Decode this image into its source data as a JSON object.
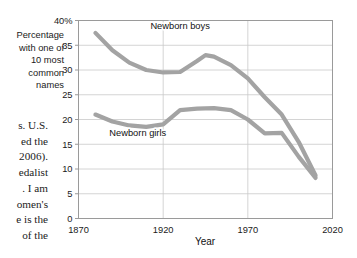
{
  "page_text": {
    "lines": [
      "s. U.S.",
      "ed the",
      "2006).",
      "edalist",
      ". I am",
      "omen's",
      "e is the",
      "of the"
    ]
  },
  "chart_data": {
    "type": "line",
    "title": "",
    "xlabel": "Year",
    "ylabel": "Percentage with one of 10 most common names",
    "ylabel_lines": [
      "Percentage",
      "with one of",
      "10 most",
      "common",
      "names"
    ],
    "xlim": [
      1870,
      2020
    ],
    "ylim": [
      0,
      40
    ],
    "xticks": [
      1870,
      1920,
      1970,
      2020
    ],
    "xtick_labels": [
      "1870",
      "1920",
      "1970",
      "2020"
    ],
    "yticks": [
      0,
      5,
      10,
      15,
      20,
      25,
      30,
      35,
      40
    ],
    "ytick_labels": [
      "0",
      "5",
      "10",
      "15",
      "20",
      "25",
      "30",
      "35",
      "40%"
    ],
    "grid": true,
    "legend_position": "inline-annotation",
    "line_color": "#a3a3a3",
    "series": [
      {
        "name": "Newborn boys",
        "label": "Newborn boys",
        "color": "#a3a3a3",
        "x": [
          1880,
          1890,
          1900,
          1910,
          1920,
          1930,
          1940,
          1945,
          1950,
          1960,
          1970,
          1980,
          1990,
          2000,
          2010
        ],
        "values": [
          37.5,
          34.0,
          31.5,
          30.0,
          29.5,
          29.6,
          31.8,
          33.0,
          32.7,
          31.0,
          28.3,
          24.5,
          21.0,
          15.5,
          8.7
        ]
      },
      {
        "name": "Newborn girls",
        "label": "Newborn girls",
        "color": "#a3a3a3",
        "x": [
          1880,
          1890,
          1900,
          1910,
          1920,
          1930,
          1940,
          1950,
          1960,
          1970,
          1980,
          1990,
          2000,
          2010
        ],
        "values": [
          21.0,
          19.6,
          18.8,
          18.5,
          19.0,
          21.9,
          22.2,
          22.3,
          21.9,
          20.0,
          17.2,
          17.3,
          12.5,
          8.2
        ]
      }
    ],
    "annotations": [
      {
        "text": "Newborn boys",
        "x": 1930,
        "y": 38.2
      },
      {
        "text": "Newborn girls",
        "x": 1905,
        "y": 16.6
      }
    ]
  }
}
